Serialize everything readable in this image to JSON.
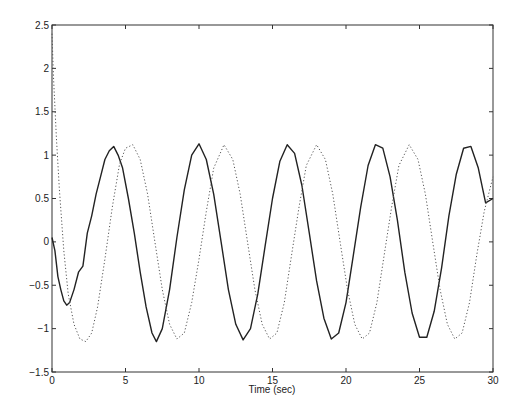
{
  "chart_data": {
    "type": "line",
    "title": "",
    "xlabel": "Time (sec)",
    "ylabel": "",
    "xlim": [
      0,
      30
    ],
    "ylim": [
      -1.5,
      2.5
    ],
    "grid": false,
    "legend": null,
    "x_ticks": [
      0,
      5,
      10,
      15,
      20,
      25,
      30
    ],
    "x_tick_labels": [
      "0",
      "5",
      "10",
      "15",
      "20",
      "25",
      "30"
    ],
    "y_ticks": [
      -1.5,
      -1,
      -0.5,
      0,
      0.5,
      1,
      1.5,
      2,
      2.5
    ],
    "y_tick_labels": [
      "-1.5",
      "-1",
      "-0.5",
      "0",
      "0.5",
      "1",
      "1.5",
      "2",
      "2.5"
    ],
    "series": [
      {
        "name": "solid",
        "style": "solid",
        "color": "#222222",
        "x": [
          0,
          0.2,
          0.4,
          0.6,
          0.8,
          1.0,
          1.2,
          1.5,
          1.8,
          2.1,
          2.4,
          2.7,
          3.0,
          3.3,
          3.6,
          3.9,
          4.2,
          4.5,
          4.8,
          5.2,
          5.6,
          6.0,
          6.4,
          6.8,
          7.1,
          7.5,
          8.0,
          8.5,
          9.0,
          9.5,
          10.0,
          10.5,
          11.0,
          11.5,
          12.0,
          12.5,
          13.0,
          13.5,
          14.0,
          14.5,
          15.0,
          15.5,
          16.0,
          16.5,
          17.0,
          17.5,
          18.0,
          18.5,
          19.0,
          19.5,
          20.0,
          20.5,
          21.0,
          21.5,
          22.0,
          22.5,
          23.0,
          23.5,
          24.0,
          24.5,
          25.0,
          25.5,
          26.0,
          26.5,
          27.0,
          27.5,
          28.0,
          28.5,
          29.0,
          29.5,
          30.0
        ],
        "y": [
          0.05,
          -0.1,
          -0.4,
          -0.55,
          -0.68,
          -0.73,
          -0.7,
          -0.55,
          -0.35,
          -0.28,
          0.1,
          0.3,
          0.55,
          0.75,
          0.95,
          1.05,
          1.1,
          1.0,
          0.85,
          0.5,
          0.1,
          -0.35,
          -0.75,
          -1.05,
          -1.15,
          -1.0,
          -0.55,
          0.05,
          0.6,
          1.0,
          1.13,
          0.95,
          0.55,
          0.0,
          -0.55,
          -0.95,
          -1.13,
          -1.0,
          -0.6,
          -0.05,
          0.5,
          0.93,
          1.12,
          1.02,
          0.65,
          0.1,
          -0.45,
          -0.88,
          -1.12,
          -1.05,
          -0.7,
          -0.15,
          0.4,
          0.88,
          1.12,
          1.08,
          0.75,
          0.25,
          -0.35,
          -0.82,
          -1.1,
          -1.1,
          -0.8,
          -0.3,
          0.3,
          0.78,
          1.08,
          1.1,
          0.85,
          0.45,
          0.5
        ]
      },
      {
        "name": "dotted",
        "style": "dotted",
        "color": "#555555",
        "x": [
          0,
          0.1,
          0.3,
          0.5,
          0.8,
          1.1,
          1.5,
          1.9,
          2.3,
          2.7,
          3.1,
          3.6,
          4.1,
          4.6,
          5.0,
          5.5,
          6.0,
          6.5,
          7.0,
          7.5,
          8.0,
          8.5,
          9.0,
          9.5,
          10.0,
          10.5,
          11.0,
          11.7,
          12.3,
          12.8,
          13.3,
          13.8,
          14.3,
          14.8,
          15.3,
          15.8,
          16.3,
          16.8,
          17.3,
          18.0,
          18.6,
          19.1,
          19.6,
          20.1,
          20.6,
          21.1,
          21.6,
          22.1,
          22.6,
          23.1,
          23.6,
          24.3,
          24.9,
          25.4,
          25.9,
          26.4,
          26.9,
          27.4,
          27.9,
          28.4,
          28.9,
          29.4,
          30.0
        ],
        "y": [
          2.4,
          1.9,
          1.2,
          0.6,
          -0.1,
          -0.6,
          -0.95,
          -1.12,
          -1.15,
          -1.05,
          -0.75,
          -0.2,
          0.4,
          0.9,
          1.08,
          1.12,
          0.95,
          0.55,
          0.0,
          -0.55,
          -0.95,
          -1.12,
          -1.05,
          -0.7,
          -0.2,
          0.35,
          0.85,
          1.12,
          0.95,
          0.55,
          0.0,
          -0.55,
          -0.95,
          -1.12,
          -1.05,
          -0.7,
          -0.15,
          0.4,
          0.88,
          1.12,
          0.95,
          0.55,
          0.0,
          -0.55,
          -0.95,
          -1.12,
          -1.05,
          -0.7,
          -0.15,
          0.4,
          0.88,
          1.12,
          0.95,
          0.55,
          0.0,
          -0.55,
          -0.95,
          -1.12,
          -1.05,
          -0.7,
          -0.15,
          0.35,
          0.75
        ]
      }
    ]
  },
  "axes": {
    "xlabel": "Time (sec)"
  }
}
